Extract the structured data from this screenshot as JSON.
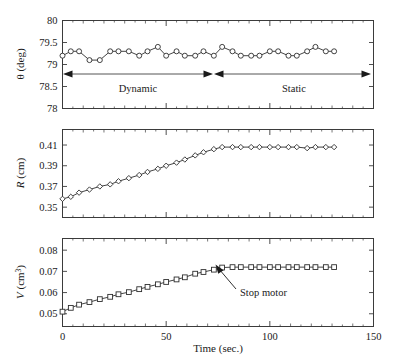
{
  "figure": {
    "background": "#ffffff",
    "line_color": "#2e2e2e",
    "axis_color": "#3b3b3b",
    "marker_fill": "#ffffff",
    "annotation_color": "#555555"
  },
  "x_axis": {
    "label": "Time (sec.)",
    "min": 0,
    "max": 150,
    "ticks": [
      0,
      50,
      100,
      150
    ],
    "tick_labels": [
      "0",
      "50",
      "100",
      "150"
    ],
    "minor_tick_step": 10
  },
  "panels": [
    {
      "id": "theta-panel",
      "ylabel_main": "θ (deg)",
      "ylabel_prefix": "θ",
      "ylabel_unit": " (deg)",
      "ymin": 78,
      "ymax": 80,
      "yticks": [
        78,
        78.5,
        79,
        79.5,
        80
      ],
      "ytick_labels": [
        "78",
        "78.5",
        "79",
        "79.5",
        "80"
      ],
      "marker": "circle"
    },
    {
      "id": "radius-panel",
      "ylabel_main": "R (cm)",
      "ylabel_prefix": "R",
      "ylabel_unit": " (cm)",
      "ymin": 0.34,
      "ymax": 0.425,
      "yticks": [
        0.35,
        0.37,
        0.39,
        0.41
      ],
      "ytick_labels": [
        "0.35",
        "0.37",
        "0.39",
        "0.41"
      ],
      "marker": "diamond"
    },
    {
      "id": "volume-panel",
      "ylabel_main": "V (cm³)",
      "ylabel_prefix": "V",
      "ylabel_unit": " (cm",
      "ylabel_sup": "3",
      "ylabel_suffix": ")",
      "ymin": 0.044,
      "ymax": 0.0855,
      "yticks": [
        0.05,
        0.06,
        0.07,
        0.08
      ],
      "ytick_labels": [
        "0.05",
        "0.06",
        "0.07",
        "0.08"
      ],
      "marker": "square"
    }
  ],
  "annotations": {
    "dynamic_label": "Dynamic",
    "static_label": "Static",
    "stop_motor_label": "Stop motor",
    "regime_split_time": 72,
    "regime_start_time": 0,
    "regime_end_time": 130,
    "stop_motor_point_time": 77,
    "stop_motor_point_value": 0.0718
  },
  "chart_data": {
    "type": "line",
    "title": "",
    "xlabel": "Time (sec.)",
    "xlim": [
      0,
      150
    ],
    "grid": false,
    "legend": "none",
    "subplots": [
      {
        "name": "contact-angle",
        "ylabel": "θ (deg)",
        "ylim": [
          78,
          80
        ],
        "yticks": [
          78,
          78.5,
          79,
          79.5,
          80
        ],
        "marker": "circle",
        "x": [
          0,
          4,
          8,
          13,
          18,
          23,
          27,
          32,
          37,
          41,
          46,
          50,
          55,
          59,
          64,
          68,
          73,
          77,
          82,
          86,
          91,
          95,
          100,
          104,
          109,
          113,
          118,
          122,
          127,
          131
        ],
        "y": [
          79.2,
          79.3,
          79.3,
          79.1,
          79.1,
          79.3,
          79.3,
          79.3,
          79.2,
          79.3,
          79.4,
          79.2,
          79.3,
          79.2,
          79.2,
          79.3,
          79.2,
          79.4,
          79.3,
          79.2,
          79.2,
          79.2,
          79.3,
          79.3,
          79.2,
          79.2,
          79.3,
          79.4,
          79.3,
          79.3
        ]
      },
      {
        "name": "drop-radius",
        "ylabel": "R (cm)",
        "ylim": [
          0.34,
          0.425
        ],
        "yticks": [
          0.35,
          0.37,
          0.39,
          0.41
        ],
        "marker": "diamond",
        "x": [
          0,
          4,
          8,
          13,
          18,
          23,
          27,
          32,
          37,
          41,
          46,
          50,
          55,
          59,
          64,
          68,
          73,
          77,
          82,
          86,
          91,
          95,
          100,
          104,
          109,
          113,
          118,
          122,
          127,
          131
        ],
        "y": [
          0.358,
          0.36,
          0.364,
          0.367,
          0.37,
          0.372,
          0.375,
          0.378,
          0.381,
          0.384,
          0.387,
          0.39,
          0.393,
          0.396,
          0.4,
          0.403,
          0.406,
          0.408,
          0.408,
          0.408,
          0.408,
          0.408,
          0.408,
          0.408,
          0.408,
          0.408,
          0.407,
          0.408,
          0.408,
          0.408
        ]
      },
      {
        "name": "drop-volume",
        "ylabel": "V (cm³)",
        "ylim": [
          0.044,
          0.0855
        ],
        "yticks": [
          0.05,
          0.06,
          0.07,
          0.08
        ],
        "marker": "square",
        "x": [
          0,
          4,
          8,
          13,
          18,
          23,
          27,
          32,
          37,
          41,
          46,
          50,
          55,
          59,
          64,
          68,
          73,
          77,
          82,
          86,
          91,
          95,
          100,
          104,
          109,
          113,
          118,
          122,
          127,
          131
        ],
        "y": [
          0.051,
          0.0528,
          0.0543,
          0.0555,
          0.0569,
          0.058,
          0.0592,
          0.0602,
          0.0616,
          0.0627,
          0.0639,
          0.065,
          0.0662,
          0.0672,
          0.0689,
          0.0697,
          0.0708,
          0.0718,
          0.072,
          0.072,
          0.072,
          0.072,
          0.072,
          0.072,
          0.072,
          0.072,
          0.072,
          0.072,
          0.072,
          0.072
        ]
      }
    ],
    "annotations": [
      {
        "text": "Dynamic",
        "kind": "span-arrow",
        "panel": "contact-angle",
        "from_x": 0,
        "to_x": 72
      },
      {
        "text": "Static",
        "kind": "span-arrow",
        "panel": "contact-angle",
        "from_x": 73,
        "to_x": 130
      },
      {
        "text": "Stop motor",
        "kind": "pointer",
        "panel": "drop-volume",
        "target_x": 77,
        "target_y": 0.0718
      }
    ]
  }
}
